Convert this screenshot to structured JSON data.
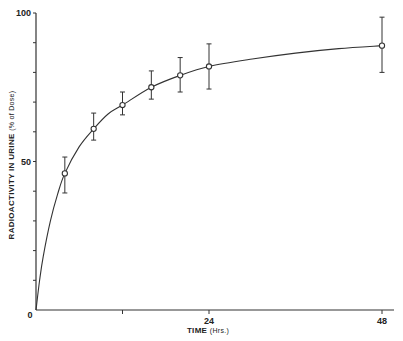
{
  "chart_data": {
    "type": "line",
    "title": "",
    "xlabel": "TIME",
    "xlabel_unit": "(Hrs.)",
    "ylabel": "RADIOACTIVITY IN URINE",
    "ylabel_unit": "(% of Dose)",
    "xlim": [
      0,
      48
    ],
    "ylim": [
      0,
      100
    ],
    "x_ticks": [
      0,
      12,
      24,
      48
    ],
    "x_tick_labels": [
      "",
      "",
      "24",
      "48"
    ],
    "y_ticks": [
      0,
      10,
      20,
      30,
      40,
      50,
      60,
      70,
      80,
      90,
      100
    ],
    "y_tick_labels": {
      "0": "0",
      "50": "50",
      "100": "100"
    },
    "origin_label": "0",
    "grid": false,
    "legend": null,
    "series": [
      {
        "name": "Cumulative urinary radioactivity",
        "marker": "open-circle",
        "x": [
          4,
          8,
          12,
          16,
          20,
          24,
          48
        ],
        "values": [
          46,
          61,
          69,
          75,
          79,
          82,
          89
        ],
        "error_upper": [
          51.5,
          66.3,
          73.4,
          80.5,
          85,
          89.6,
          98.6
        ],
        "error_lower": [
          39.4,
          57.2,
          65.7,
          71,
          73.4,
          74.4,
          80
        ]
      }
    ],
    "fitted_curve": {
      "description": "smooth curve through origin fitted to points",
      "x": [
        0,
        0.5,
        1,
        2,
        3,
        4,
        6,
        8,
        10,
        12,
        16,
        20,
        24,
        30,
        36,
        42,
        48
      ],
      "y": [
        0,
        10,
        18,
        30,
        39,
        46,
        55,
        61,
        66,
        69,
        75,
        79,
        82,
        84.5,
        86.5,
        88,
        89
      ]
    }
  }
}
